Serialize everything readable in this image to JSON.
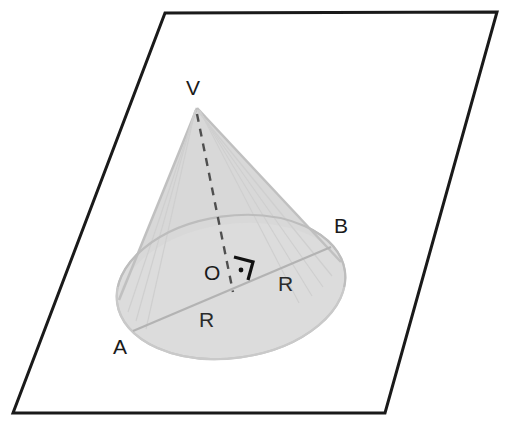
{
  "figure": {
    "type": "geometric-diagram",
    "background_color": "#ffffff",
    "plane": {
      "name": "parallelogram-plane",
      "stroke_color": "#1a1a1a",
      "stroke_width": 3,
      "fill": "none",
      "points": "165,13 497,12 385,413 13,413"
    },
    "cone": {
      "name": "cone-solid",
      "fill_color": "#d9d9d9",
      "edge_color": "#c2c2c2",
      "apex": {
        "x": 197,
        "y": 108
      },
      "base_ellipse": {
        "cx": 231,
        "cy": 287,
        "rx": 115,
        "ry": 71,
        "rotation": -8
      }
    },
    "axis": {
      "name": "cone-axis-dashed",
      "stroke_color": "#4a4a4a",
      "dash": "8 7",
      "from": {
        "x": 197,
        "y": 112
      },
      "to": {
        "x": 233,
        "y": 290
      }
    },
    "diameter": {
      "name": "diameter-segment-AB",
      "stroke_color": "#b5b5b5",
      "from": {
        "x": 133,
        "y": 331
      },
      "to": {
        "x": 331,
        "y": 247
      }
    },
    "right_angle_marker": {
      "name": "right-angle-marker",
      "stroke_color": "#111111",
      "dot_color": "#111111"
    },
    "labels": [
      {
        "id": "V",
        "text": "V",
        "x": 186,
        "y": 95,
        "kind": "vertex",
        "meaning": "apex"
      },
      {
        "id": "B",
        "text": "B",
        "x": 334,
        "y": 233,
        "kind": "vertex",
        "meaning": "base-circle-point-right"
      },
      {
        "id": "O",
        "text": "O",
        "x": 204,
        "y": 280,
        "kind": "vertex",
        "meaning": "base-center"
      },
      {
        "id": "A",
        "text": "A",
        "x": 113,
        "y": 354,
        "kind": "vertex",
        "meaning": "base-circle-point-left"
      },
      {
        "id": "R1",
        "text": "R",
        "x": 199,
        "y": 327,
        "kind": "measure",
        "meaning": "radius-O-to-A"
      },
      {
        "id": "R2",
        "text": "R",
        "x": 278,
        "y": 291,
        "kind": "measure",
        "meaning": "radius-O-to-B"
      }
    ]
  }
}
